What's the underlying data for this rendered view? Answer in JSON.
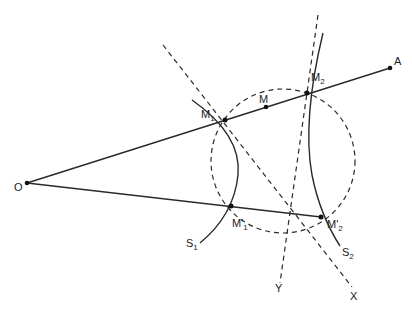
{
  "diagram": {
    "points": {
      "O": {
        "label": "O",
        "x": 27,
        "y": 183
      },
      "A": {
        "label": "A",
        "x": 390,
        "y": 68
      },
      "M": {
        "label": "M",
        "x": 266,
        "y": 107
      },
      "M1": {
        "label": "M",
        "sub": "1",
        "x": 225,
        "y": 120
      },
      "M2": {
        "label": "M",
        "sub": "2",
        "x": 307,
        "y": 93
      },
      "M1p": {
        "label": "M'",
        "sub": "1",
        "x": 231,
        "y": 206
      },
      "M2p": {
        "label": "M'",
        "sub": "2",
        "x": 321,
        "y": 217
      }
    },
    "curves": {
      "S1": {
        "label": "S",
        "sub": "1"
      },
      "S2": {
        "label": "S",
        "sub": "2"
      }
    },
    "lines": {
      "X": {
        "label": "X"
      },
      "Y": {
        "label": "Y"
      }
    },
    "colors": {
      "stroke": "#2a2a2a",
      "background": "#ffffff"
    }
  }
}
